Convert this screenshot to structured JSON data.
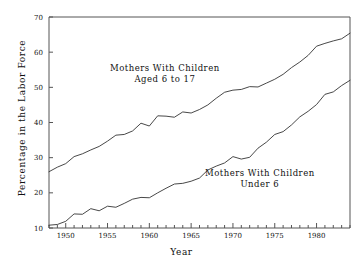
{
  "chart_data": {
    "type": "line",
    "title": "",
    "subtitle": "",
    "xlabel": "Year",
    "ylabel": "Percentage in the Labor Force",
    "xlim": [
      1948,
      1984
    ],
    "ylim": [
      10,
      70
    ],
    "yticks": [
      10,
      20,
      30,
      40,
      50,
      60,
      70
    ],
    "ytick_labels": [
      "10",
      "20",
      "30",
      "40",
      "50",
      "60",
      "70"
    ],
    "xticks": [
      1950,
      1955,
      1960,
      1965,
      1970,
      1975,
      1980
    ],
    "xtick_labels": [
      "1950",
      "1955",
      "1960",
      "1965",
      "1970",
      "1975",
      "1980"
    ],
    "minor_xticks_every": 1,
    "grid": false,
    "legend": "inline-annotations",
    "line_color": "#333333",
    "axis_color": "#555555",
    "background": "#ffffff",
    "x": [
      1948,
      1949,
      1950,
      1951,
      1952,
      1953,
      1954,
      1955,
      1956,
      1957,
      1958,
      1959,
      1960,
      1961,
      1962,
      1963,
      1964,
      1965,
      1966,
      1967,
      1968,
      1969,
      1970,
      1971,
      1972,
      1973,
      1974,
      1975,
      1976,
      1977,
      1978,
      1979,
      1980,
      1981,
      1982,
      1983,
      1984
    ],
    "series": [
      {
        "name": "Mothers With Children Aged 6 to 17",
        "label_line1": "Mothers With Children",
        "label_line2": "Aged 6 to 17",
        "values": [
          26.0,
          27.3,
          28.3,
          30.3,
          31.1,
          32.2,
          33.2,
          34.7,
          36.4,
          36.6,
          37.6,
          39.8,
          39.0,
          41.9,
          41.8,
          41.5,
          43.0,
          42.7,
          43.7,
          45.0,
          46.9,
          48.6,
          49.2,
          49.4,
          50.2,
          50.1,
          51.2,
          52.3,
          53.7,
          55.6,
          57.2,
          59.1,
          61.7,
          62.5,
          63.2,
          63.8,
          65.4
        ]
      },
      {
        "name": "Mothers With Children Under 6",
        "label_line1": "Mothers With Children",
        "label_line2": "Under 6",
        "values": [
          10.8,
          11.0,
          11.9,
          14.0,
          13.9,
          15.5,
          14.9,
          16.2,
          15.9,
          17.0,
          18.2,
          18.7,
          18.6,
          20.0,
          21.3,
          22.5,
          22.7,
          23.3,
          24.2,
          26.5,
          27.6,
          28.5,
          30.3,
          29.6,
          30.1,
          32.7,
          34.4,
          36.6,
          37.4,
          39.3,
          41.6,
          43.2,
          45.1,
          48.0,
          48.7,
          50.5,
          52.0
        ]
      }
    ]
  }
}
